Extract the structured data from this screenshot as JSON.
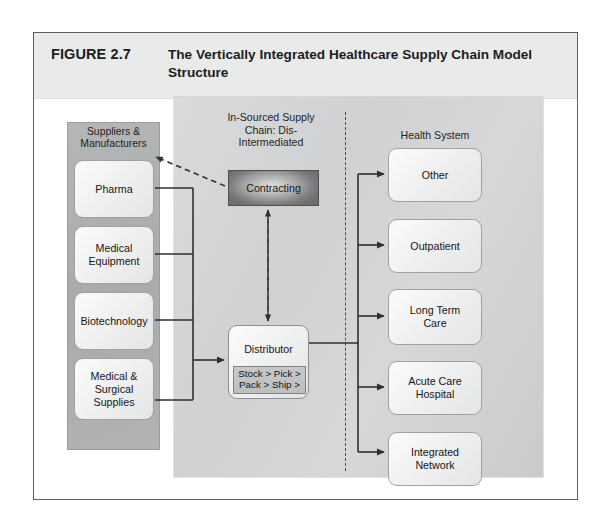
{
  "figure": {
    "number": "FIGURE 2.7",
    "title": "The Vertically Integrated Healthcare Supply Chain Model Structure"
  },
  "panels": {
    "suppliers_heading": "Suppliers &\nManufacturers",
    "in_sourced_heading": "In-Sourced Supply\nChain: Dis-\nIntermediated",
    "health_system_heading": "Health System"
  },
  "suppliers": [
    {
      "label": "Pharma"
    },
    {
      "label": "Medical\nEquipment"
    },
    {
      "label": "Biotechnology"
    },
    {
      "label": "Medical &\nSurgical\nSupplies"
    }
  ],
  "center": {
    "contracting": "Contracting",
    "distributor": "Distributor",
    "distributor_steps": "Stock > Pick >\nPack > Ship >"
  },
  "health_system": [
    {
      "label": "Other"
    },
    {
      "label": "Outpatient"
    },
    {
      "label": "Long Term\nCare"
    },
    {
      "label": "Acute Care\nHospital"
    },
    {
      "label": "Integrated\nNetwork"
    }
  ],
  "colors": {
    "title_band": "#e9eaea",
    "main_panel": "#d4d6d7",
    "suppliers_panel": "#adafb0",
    "contracting_dark": "#6c6e6f",
    "node_fill": "#f2f2f2",
    "line": "#2e3031",
    "frame_border": "#5d5f61"
  }
}
